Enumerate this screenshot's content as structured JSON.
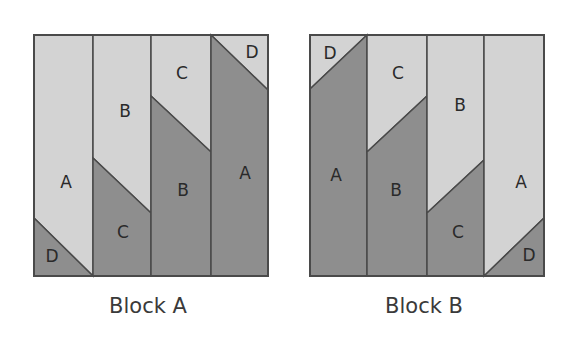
{
  "colors": {
    "light": "#d3d3d3",
    "dark": "#8e8e8e",
    "stroke": "#4a4a4a"
  },
  "blocks": [
    {
      "caption": "Block A",
      "labels": {
        "col1_top": "A",
        "col1_bottom": "D",
        "col2_top": "B",
        "col2_bottom": "C",
        "col3_top": "C",
        "col3_bottom": "B",
        "col4_top": "D",
        "col4_bottom": "A"
      }
    },
    {
      "caption": "Block B",
      "labels": {
        "col1_top": "D",
        "col1_bottom": "A",
        "col2_top": "C",
        "col2_bottom": "B",
        "col3_top": "B",
        "col3_bottom": "C",
        "col4_top": "A",
        "col4_bottom": "D"
      }
    }
  ]
}
